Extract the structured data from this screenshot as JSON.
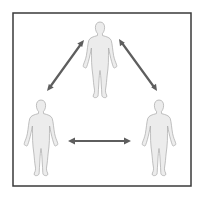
{
  "diagram": {
    "type": "three-person relationship triangle",
    "frame": {
      "x": 13,
      "y": 13,
      "width": 178,
      "height": 173,
      "stroke_color": "#3a3a3a"
    },
    "figures": [
      {
        "id": "top",
        "icon": "person-icon",
        "cx": 100,
        "top": 22,
        "bottom": 98
      },
      {
        "id": "bottom-left",
        "icon": "person-icon",
        "cx": 41,
        "top": 100,
        "bottom": 175
      },
      {
        "id": "bottom-right",
        "icon": "person-icon",
        "cx": 159,
        "top": 100,
        "bottom": 175
      }
    ],
    "arrows": [
      {
        "id": "top-to-left",
        "icon": "double-arrow-icon",
        "from": [
          84,
          40
        ],
        "to": [
          47,
          91
        ]
      },
      {
        "id": "top-to-right",
        "icon": "double-arrow-icon",
        "from": [
          119,
          39
        ],
        "to": [
          157,
          91
        ]
      },
      {
        "id": "left-to-right",
        "icon": "double-arrow-icon",
        "from": [
          68,
          141
        ],
        "to": [
          131,
          141
        ]
      }
    ],
    "colors": {
      "figure_fill": "#ececec",
      "figure_outline": "#a8a8a8",
      "arrow": "#5e5e5e",
      "background": "#ffffff"
    }
  }
}
